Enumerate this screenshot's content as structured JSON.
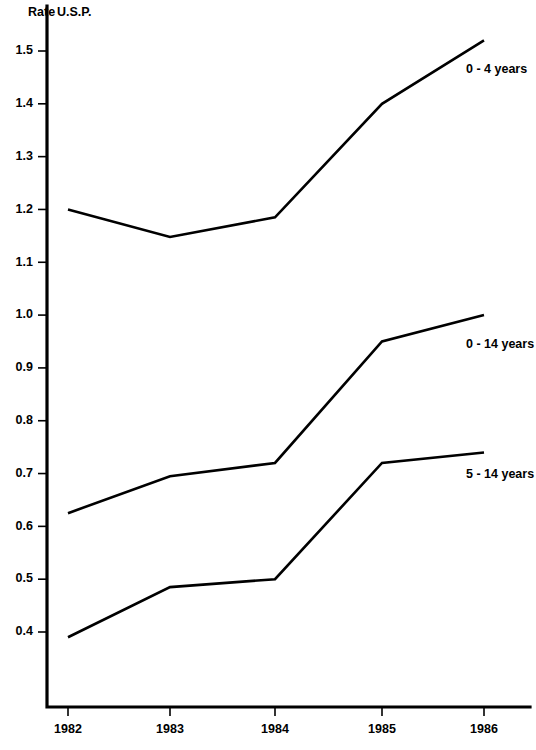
{
  "chart_data": {
    "type": "line",
    "title": "",
    "subtitle": "",
    "xlabel": "",
    "ylabel": "Rate",
    "unit_label": "U.S.P.",
    "x": [
      1982,
      1983,
      1984,
      1985,
      1986
    ],
    "categories": [
      "1982",
      "1983",
      "1984",
      "1985",
      "1986"
    ],
    "xlim": [
      1982,
      1986
    ],
    "ylim": [
      0.35,
      1.55
    ],
    "yticks": [
      0.4,
      0.5,
      0.6,
      0.7,
      0.8,
      0.9,
      1.0,
      1.1,
      1.2,
      1.3,
      1.4,
      1.5
    ],
    "ytick_labels": [
      "0.4",
      "0.5",
      "0.6",
      "0.7",
      "0.8",
      "0.9",
      "1.0",
      "1.1",
      "1.2",
      "1.3",
      "1.4",
      "1.5"
    ],
    "grid": false,
    "legend_position": "right-inline",
    "series": [
      {
        "name": "0 - 4 years",
        "values": [
          1.2,
          1.148,
          1.185,
          1.4,
          1.52
        ]
      },
      {
        "name": "0 - 14 years",
        "values": [
          0.625,
          0.695,
          0.72,
          0.95,
          1.0
        ]
      },
      {
        "name": "5 - 14 years",
        "values": [
          0.39,
          0.485,
          0.5,
          0.72,
          0.74
        ]
      }
    ]
  }
}
